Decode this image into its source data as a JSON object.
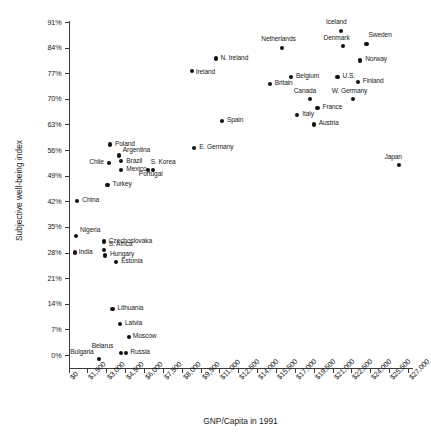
{
  "chart_data": {
    "type": "scatter",
    "title": "",
    "xlabel": "GNP/Capita in 1991",
    "ylabel": "Subjective well-being index",
    "xlim": [
      0,
      27000
    ],
    "ylim": [
      0,
      91
    ],
    "grid": false,
    "legend": "none",
    "xticks": [
      "$0",
      "$1,500",
      "$3,000",
      "$4,500",
      "$6,000",
      "$7,500",
      "$8,000",
      "$9,500",
      "$11,000",
      "$12,500",
      "$14,000",
      "$15,500",
      "$17,000",
      "$19,500",
      "$21,000",
      "$22,500",
      "$24,000",
      "$25,500",
      "$27,000"
    ],
    "yticks": [
      "0%",
      "7%",
      "14%",
      "21%",
      "28%",
      "35%",
      "42%",
      "49%",
      "56%",
      "63%",
      "70%",
      "77%",
      "84%",
      "91%"
    ],
    "points": [
      {
        "name": "Iceland",
        "x": 21700,
        "y": 88.5,
        "lx": -5,
        "ly": -11,
        "align": "center"
      },
      {
        "name": "Sweden",
        "x": 23700,
        "y": 85.0,
        "lx": 2,
        "ly": -11,
        "align": "left"
      },
      {
        "name": "Netherlands",
        "x": 17000,
        "y": 84.0,
        "lx": -5,
        "ly": -11,
        "align": "center"
      },
      {
        "name": "Denmark",
        "x": 21800,
        "y": 84.5,
        "lx": -6,
        "ly": -10,
        "align": "center"
      },
      {
        "name": "Norway",
        "x": 23200,
        "y": 80.5,
        "lx": 5,
        "ly": -3,
        "align": "left"
      },
      {
        "name": "N. Ireland",
        "x": 11700,
        "y": 81.0,
        "lx": 5,
        "ly": -3,
        "align": "left"
      },
      {
        "name": "Ireland",
        "x": 9800,
        "y": 77.5,
        "lx": 4,
        "ly": -1,
        "align": "left"
      },
      {
        "name": "Belgium",
        "x": 17700,
        "y": 76.0,
        "lx": 5,
        "ly": -3,
        "align": "left"
      },
      {
        "name": "U.S.",
        "x": 21400,
        "y": 76.0,
        "lx": 5,
        "ly": -3,
        "align": "left"
      },
      {
        "name": "Finland",
        "x": 23000,
        "y": 74.5,
        "lx": 5,
        "ly": -3,
        "align": "left"
      },
      {
        "name": "Britain",
        "x": 16000,
        "y": 74.0,
        "lx": 5,
        "ly": -3,
        "align": "left"
      },
      {
        "name": "Canada",
        "x": 19200,
        "y": 70.0,
        "lx": -5,
        "ly": -10,
        "align": "center"
      },
      {
        "name": "W. Germany",
        "x": 22600,
        "y": 70.0,
        "lx": -5,
        "ly": -10,
        "align": "center"
      },
      {
        "name": "France",
        "x": 19800,
        "y": 67.5,
        "lx": 5,
        "ly": -3,
        "align": "left"
      },
      {
        "name": "Italy",
        "x": 18200,
        "y": 65.5,
        "lx": 5,
        "ly": -3,
        "align": "left"
      },
      {
        "name": "Austria",
        "x": 19500,
        "y": 63.0,
        "lx": 5,
        "ly": -3,
        "align": "left"
      },
      {
        "name": "Spain",
        "x": 12200,
        "y": 64.0,
        "lx": 5,
        "ly": -3,
        "align": "left"
      },
      {
        "name": "E. Germany",
        "x": 10000,
        "y": 56.5,
        "lx": 5,
        "ly": -3,
        "align": "left"
      },
      {
        "name": "Japan",
        "x": 26300,
        "y": 52.0,
        "lx": -6,
        "ly": -10,
        "align": "center"
      },
      {
        "name": "Poland",
        "x": 3300,
        "y": 57.5,
        "lx": 5,
        "ly": -3,
        "align": "left"
      },
      {
        "name": "Argentina",
        "x": 4000,
        "y": 54.5,
        "lx": 4,
        "ly": -8,
        "align": "left"
      },
      {
        "name": "Chile",
        "x": 3200,
        "y": 52.5,
        "lx": -5,
        "ly": -3,
        "align": "right"
      },
      {
        "name": "Brazil",
        "x": 4200,
        "y": 53.0,
        "lx": 5,
        "ly": -2,
        "align": "left"
      },
      {
        "name": "Mexico",
        "x": 4200,
        "y": 50.5,
        "lx": 5,
        "ly": -3,
        "align": "left"
      },
      {
        "name": "S. Korea",
        "x": 6300,
        "y": 50.5,
        "lx": 3,
        "ly": -10,
        "align": "left"
      },
      {
        "name": "Portugal",
        "x": 6700,
        "y": 50.5,
        "lx": -2,
        "ly": 2,
        "align": "center"
      },
      {
        "name": "Turkey",
        "x": 3100,
        "y": 46.5,
        "lx": 5,
        "ly": -3,
        "align": "left"
      },
      {
        "name": "China",
        "x": 700,
        "y": 42.0,
        "lx": 5,
        "ly": -3,
        "align": "left"
      },
      {
        "name": "Nigeria",
        "x": 600,
        "y": 32.5,
        "lx": 4,
        "ly": -8,
        "align": "left"
      },
      {
        "name": "Czechoslovaka",
        "x": 2800,
        "y": 31.0,
        "lx": 5,
        "ly": -3,
        "align": "left"
      },
      {
        "name": "S. Africa",
        "x": 2800,
        "y": 28.8,
        "lx": 5,
        "ly": -8,
        "align": "left"
      },
      {
        "name": "India",
        "x": 500,
        "y": 28.0,
        "lx": 4,
        "ly": -3,
        "align": "left"
      },
      {
        "name": "Hungary",
        "x": 2900,
        "y": 27.2,
        "lx": 5,
        "ly": -3,
        "align": "left"
      },
      {
        "name": "Estonia",
        "x": 3800,
        "y": 25.5,
        "lx": 5,
        "ly": -3,
        "align": "left"
      },
      {
        "name": "Lithuania",
        "x": 3500,
        "y": 12.5,
        "lx": 5,
        "ly": -3,
        "align": "left"
      },
      {
        "name": "Latvia",
        "x": 4100,
        "y": 8.5,
        "lx": 5,
        "ly": -3,
        "align": "left"
      },
      {
        "name": "Moscow",
        "x": 4800,
        "y": 5.0,
        "lx": 4,
        "ly": -3,
        "align": "left"
      },
      {
        "name": "Belarus",
        "x": 4200,
        "y": 0.5,
        "lx": -8,
        "ly": -9,
        "align": "right"
      },
      {
        "name": "Russia",
        "x": 4600,
        "y": 0.5,
        "lx": 4,
        "ly": -3,
        "align": "left"
      },
      {
        "name": "Bulgaria",
        "x": 2400,
        "y": -1.0,
        "lx": -5,
        "ly": -9,
        "align": "right"
      }
    ]
  },
  "caption": ""
}
